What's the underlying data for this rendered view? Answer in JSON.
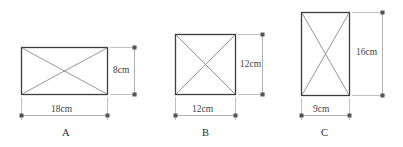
{
  "diagram": {
    "unit": "cm",
    "colors": {
      "rect_stroke": "#3d3d3d",
      "diagonal_stroke": "#8a8a8a",
      "dimension_stroke": "#9a9a9a",
      "text": "#3a3a3a",
      "background": "#ffffff"
    },
    "figures": [
      {
        "id": "A",
        "name": "figure-a",
        "label": "A",
        "width_label": "18cm",
        "height_label": "8cm",
        "width_cm": 18,
        "height_cm": 8,
        "shape": "rectangle",
        "has_diagonals": true,
        "rect": {
          "x": 21,
          "y": 47,
          "w": 87,
          "h": 48
        },
        "width_dim": {
          "y": 115,
          "x1": 21,
          "x2": 108
        },
        "height_dim": {
          "x": 134,
          "y1": 47,
          "y2": 95
        },
        "width_label_pos": {
          "x": 51,
          "y": 105
        },
        "height_label_pos": {
          "x": 113,
          "y": 66
        },
        "fig_label_pos": {
          "x": 62,
          "y": 128
        }
      },
      {
        "id": "B",
        "name": "figure-b",
        "label": "B",
        "width_label": "12cm",
        "height_label": "12cm",
        "width_cm": 12,
        "height_cm": 12,
        "shape": "square",
        "has_diagonals": true,
        "rect": {
          "x": 175,
          "y": 34,
          "w": 61,
          "h": 61
        },
        "width_dim": {
          "y": 115,
          "x1": 175,
          "x2": 236
        },
        "height_dim": {
          "x": 262,
          "y1": 34,
          "y2": 95
        },
        "width_label_pos": {
          "x": 192,
          "y": 105
        },
        "height_label_pos": {
          "x": 240,
          "y": 60
        },
        "fig_label_pos": {
          "x": 202,
          "y": 128
        }
      },
      {
        "id": "C",
        "name": "figure-c",
        "label": "C",
        "width_label": "9cm",
        "height_label": "16cm",
        "width_cm": 9,
        "height_cm": 16,
        "shape": "rectangle",
        "has_diagonals": true,
        "rect": {
          "x": 301,
          "y": 12,
          "w": 49,
          "h": 84
        },
        "width_dim": {
          "y": 115,
          "x1": 301,
          "x2": 350
        },
        "height_dim": {
          "x": 382,
          "y1": 12,
          "y2": 96
        },
        "width_label_pos": {
          "x": 313,
          "y": 105
        },
        "height_label_pos": {
          "x": 356,
          "y": 48
        },
        "fig_label_pos": {
          "x": 321,
          "y": 128
        }
      }
    ]
  }
}
